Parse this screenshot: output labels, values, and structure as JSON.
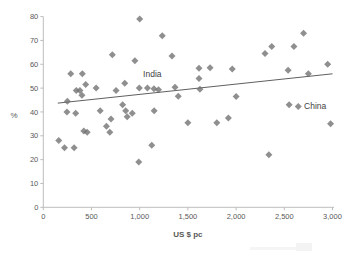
{
  "chart_data": {
    "type": "scatter",
    "title": "",
    "xlabel": "US $ pc",
    "ylabel": "%",
    "xlim": [
      0,
      3000
    ],
    "ylim": [
      0,
      80
    ],
    "xticks": [
      0,
      500,
      1000,
      1500,
      2000,
      2500,
      3000
    ],
    "xtick_labels": [
      "0",
      "500",
      "1,000",
      "1,500",
      "2,000",
      "2,500",
      "3,000"
    ],
    "yticks": [
      0,
      10,
      20,
      30,
      40,
      50,
      60,
      70,
      80
    ],
    "ytick_labels": [
      "0",
      "10",
      "20",
      "30",
      "40",
      "50",
      "60",
      "70",
      "80"
    ],
    "grid": false,
    "legend": "none",
    "marker": {
      "shape": "diamond",
      "color": "#6f6f6f",
      "opacity": 0.78,
      "size_px": 7
    },
    "trendline": {
      "x1": 150,
      "y1": 43.7,
      "x2": 3000,
      "y2": 56.0,
      "color": "#4d4d4d"
    },
    "annotations": [
      {
        "label": "India",
        "x": 1035,
        "y": 54.5
      },
      {
        "label": "China",
        "x": 2705,
        "y": 41.2
      }
    ],
    "colors": {
      "axis": "#bdbdbd",
      "tick_labels": "#595959",
      "axis_title": "#595959",
      "annotation": "#3f3f3f",
      "background": "#ffffff"
    },
    "points": [
      [
        160,
        28
      ],
      [
        220,
        25
      ],
      [
        320,
        25
      ],
      [
        245,
        40
      ],
      [
        336,
        39.5
      ],
      [
        250,
        44.5
      ],
      [
        285,
        56
      ],
      [
        405,
        56
      ],
      [
        440,
        51.5
      ],
      [
        342,
        49
      ],
      [
        380,
        49
      ],
      [
        401,
        47
      ],
      [
        420,
        32
      ],
      [
        455,
        31.5
      ],
      [
        548,
        50
      ],
      [
        590,
        40.5
      ],
      [
        655,
        34
      ],
      [
        690,
        31.5
      ],
      [
        702,
        37
      ],
      [
        716,
        64
      ],
      [
        755,
        49
      ],
      [
        823,
        43
      ],
      [
        855,
        40.5
      ],
      [
        870,
        38
      ],
      [
        923,
        39.5
      ],
      [
        845,
        52
      ],
      [
        950,
        61.5
      ],
      [
        996,
        50
      ],
      [
        1000,
        79
      ],
      [
        990,
        19
      ],
      [
        1080,
        50
      ],
      [
        1148,
        49.7
      ],
      [
        1195,
        49.3
      ],
      [
        1125,
        26
      ],
      [
        1150,
        40.5
      ],
      [
        1234,
        72
      ],
      [
        1335,
        63.5
      ],
      [
        1366,
        50.4
      ],
      [
        1400,
        46.6
      ],
      [
        1500,
        35.5
      ],
      [
        1615,
        58.3
      ],
      [
        1615,
        54
      ],
      [
        1625,
        49.5
      ],
      [
        1730,
        58.5
      ],
      [
        1800,
        35.5
      ],
      [
        1920,
        37.5
      ],
      [
        1960,
        58
      ],
      [
        2000,
        46.5
      ],
      [
        2300,
        64.5
      ],
      [
        2370,
        67.5
      ],
      [
        2600,
        67.5
      ],
      [
        2540,
        57.5
      ],
      [
        2550,
        43
      ],
      [
        2645,
        42.3
      ],
      [
        2700,
        73
      ],
      [
        2750,
        56
      ],
      [
        2950,
        60
      ],
      [
        2980,
        35
      ],
      [
        2340,
        22
      ]
    ]
  }
}
